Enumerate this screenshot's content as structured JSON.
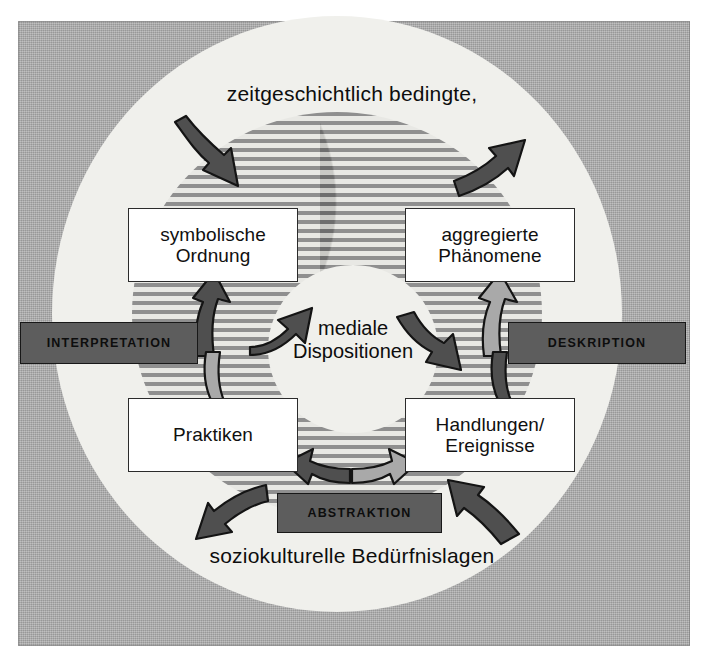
{
  "figure": {
    "title_top": "zeitgeschichtlich bedingte,",
    "title_bottom": "soziokulturelle Bedürfnislagen",
    "center": {
      "line1": "mediale",
      "line2": "Dispositionen"
    }
  },
  "boxes": {
    "top_left": {
      "line1": "symbolische",
      "line2": "Ordnung"
    },
    "top_right": {
      "line1": "aggregierte",
      "line2": "Phänomene"
    },
    "bottom_left": {
      "line1": "Praktiken",
      "line2": ""
    },
    "bottom_right": {
      "line1": "Handlungen/",
      "line2": "Ereignisse"
    }
  },
  "banners": {
    "left": "INTERPRETATION",
    "right": "DESKRIPTION",
    "bottom": "ABSTRAKTION"
  },
  "colors": {
    "frame_gray": "#a8a8a8",
    "disc_light": "#f0f0ec",
    "stripe_dark": "#8f8f8f",
    "stripe_light": "#e8e8e4",
    "banner_fill": "#5d5d5d",
    "arrow_dark": "#4f4f4f",
    "arrow_light": "#a9a9a9",
    "box_fill": "#ffffff",
    "outline": "#1d1d1d",
    "text": "#0d0d0d"
  },
  "arrows": {
    "inflow_top_left": "curved arrow entering the striped ring from upper left",
    "outflow_top_right": "curved arrow leaving the striped ring to upper right",
    "outflow_bottom_left": "curved arrow leaving toward lower left",
    "inflow_bottom_right": "curved arrow entering from lower right",
    "left_pair": "double-headed curved arrow between symbolische Ordnung and Praktiken",
    "right_pair": "double-headed curved arrow between aggregierte Phänomene and Handlungen/Ereignisse",
    "bottom_pair": "double-headed curved arrow above ABSTRAKTION",
    "center_left": "curved arrow pointing up-right into mediale Dispositionen",
    "center_right": "curved arrow pointing down-right out of mediale Dispositionen"
  }
}
